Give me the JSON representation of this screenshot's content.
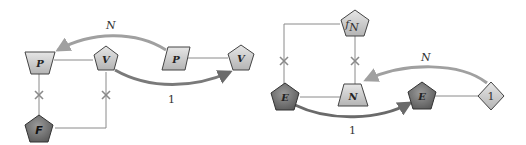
{
  "colors": {
    "light_fill": "#cfcfcf",
    "dark_fill": "#6e6e6e",
    "stroke": "#444444",
    "connector": "#8a8a8a",
    "arrow_light": "#a0a0a0",
    "arrow_dark": "#6a6a6a"
  },
  "left": {
    "nodes": {
      "p_trapezoid": "P",
      "v_pentagon": "V",
      "p_parallelogram": "P",
      "v_pentagon_right": "V",
      "f_pentagon": "F"
    },
    "edges": {
      "top_arrow_label": "N",
      "bottom_arrow_label": "1"
    }
  },
  "right": {
    "nodes": {
      "fn_pentagon_main": "f",
      "fn_pentagon_sub": "N",
      "e_pentagon_left": "E",
      "n_trapezoid": "N",
      "e_pentagon_right": "E",
      "one_diamond": "1"
    },
    "edges": {
      "top_arrow_label": "N",
      "bottom_arrow_label": "1"
    }
  }
}
